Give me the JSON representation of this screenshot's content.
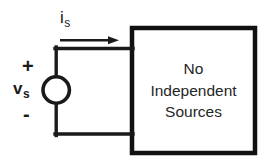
{
  "figure": {
    "type": "circuit-diagram",
    "background_color": "#ffffff",
    "line_color": "#1a1a1a",
    "box_border_color": "#111111"
  },
  "source": {
    "symbol_name": "independent-voltage-source",
    "shape": "circle",
    "voltage_label": "v",
    "voltage_subscript": "s",
    "plus_sign": "+",
    "minus_sign": "-"
  },
  "current": {
    "label": "i",
    "subscript": "s",
    "arrow_direction": "right"
  },
  "black_box": {
    "lines": [
      "No",
      "Independent",
      "Sources"
    ]
  }
}
